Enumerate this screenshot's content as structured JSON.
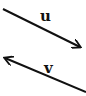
{
  "diagram": {
    "type": "vectors",
    "line_color": "#111111",
    "background": "#ffffff",
    "vectors": [
      {
        "label": "u",
        "tail": [
          3,
          9
        ],
        "head": [
          80,
          47
        ]
      },
      {
        "label": "v",
        "tail": [
          86,
          92
        ],
        "head": [
          5,
          58
        ]
      }
    ]
  }
}
